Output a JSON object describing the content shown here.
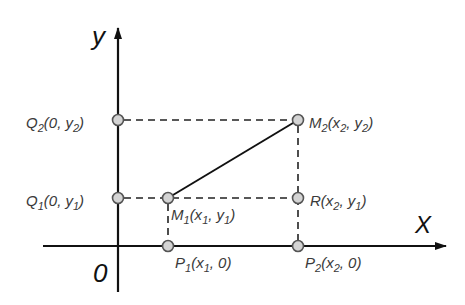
{
  "diagram": {
    "axes": {
      "x_label": "X",
      "y_label": "y",
      "origin_label": "0"
    },
    "points": [
      {
        "id": "Q2",
        "label": "Q",
        "sub": "2",
        "rest_a": "(0, y",
        "sub2": "2",
        "rest_b": ")",
        "x": 118,
        "y": 120
      },
      {
        "id": "Q1",
        "label": "Q",
        "sub": "1",
        "rest_a": "(0, y",
        "sub2": "1",
        "rest_b": ")",
        "x": 118,
        "y": 198
      },
      {
        "id": "M1",
        "label": "M",
        "sub": "1",
        "rest_a": "(x",
        "sub2": "1",
        "rest_c": ", y",
        "sub3": "1",
        "rest_b": ")",
        "x": 168,
        "y": 198
      },
      {
        "id": "M2",
        "label": "M",
        "sub": "2",
        "rest_a": "(x",
        "sub2": "2",
        "rest_c": ", y",
        "sub3": "2",
        "rest_b": ")",
        "x": 298,
        "y": 120
      },
      {
        "id": "R",
        "label": "R",
        "rest_a": "(x",
        "sub2": "2",
        "rest_c": ", y",
        "sub3": "1",
        "rest_b": ")",
        "x": 298,
        "y": 198
      },
      {
        "id": "P1",
        "label": "P",
        "sub": "1",
        "rest_a": "(x",
        "sub2": "1",
        "rest_c": ", 0)",
        "x": 168,
        "y": 246
      },
      {
        "id": "P2",
        "label": "P",
        "sub": "2",
        "rest_a": "(x",
        "sub2": "2",
        "rest_c": ", 0)",
        "x": 298,
        "y": 246
      }
    ],
    "colors": {
      "line": "#111111",
      "point_fill": "#d4d4d4",
      "point_stroke": "#555555",
      "label": "#3a3a3a"
    }
  }
}
